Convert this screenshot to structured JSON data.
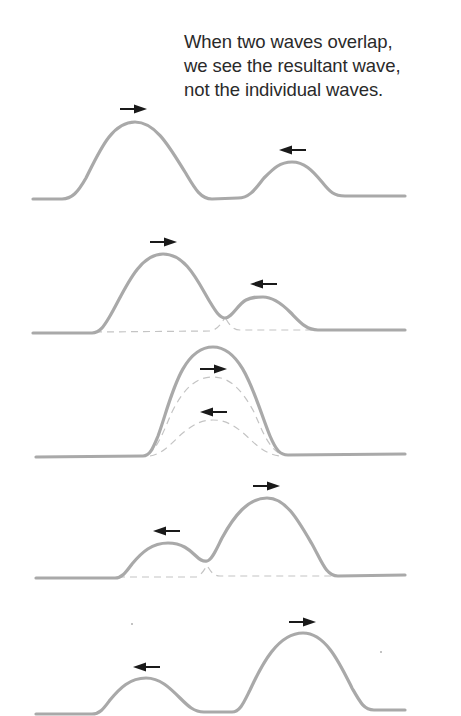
{
  "caption": {
    "lines": [
      "When two waves overlap,",
      "we see the resultant wave,",
      "not the individual waves."
    ]
  },
  "frames": [
    {
      "id": 1,
      "description": "Two separate pulses approaching each other",
      "pulses": [
        {
          "name": "large pulse",
          "direction": "right",
          "peak_x": 135,
          "peak_y": 122
        },
        {
          "name": "small pulse",
          "direction": "left",
          "peak_x": 292,
          "peak_y": 162
        }
      ],
      "overlap": false
    },
    {
      "id": 2,
      "description": "Pulses beginning to overlap",
      "pulses": [
        {
          "name": "large pulse",
          "direction": "right",
          "peak_x": 163,
          "peak_y": 254
        },
        {
          "name": "small pulse",
          "direction": "left",
          "peak_x": 263,
          "peak_y": 297
        }
      ],
      "overlap": true
    },
    {
      "id": 3,
      "description": "Pulses fully overlapping; resultant is the sum",
      "pulses": [
        {
          "name": "large pulse",
          "direction": "right",
          "peak_x": 213,
          "peak_y": 377
        },
        {
          "name": "small pulse",
          "direction": "left",
          "peak_x": 213,
          "peak_y": 420
        }
      ],
      "resultant_peak_y": 347,
      "overlap": true
    },
    {
      "id": 4,
      "description": "Pulses separating after overlap",
      "pulses": [
        {
          "name": "small pulse",
          "direction": "left",
          "peak_x": 168,
          "peak_y": 543
        },
        {
          "name": "large pulse",
          "direction": "right",
          "peak_x": 267,
          "peak_y": 498
        }
      ],
      "overlap": true
    },
    {
      "id": 5,
      "description": "Pulses have passed through each other unchanged",
      "pulses": [
        {
          "name": "small pulse",
          "direction": "left",
          "peak_x": 146,
          "peak_y": 678
        },
        {
          "name": "large pulse",
          "direction": "right",
          "peak_x": 303,
          "peak_y": 633
        }
      ],
      "overlap": false
    }
  ],
  "colors": {
    "wave": "#a9a9a9",
    "dashed": "#c4c4c4",
    "arrow": "#1a1a1a",
    "text": "#2a2a2a"
  }
}
